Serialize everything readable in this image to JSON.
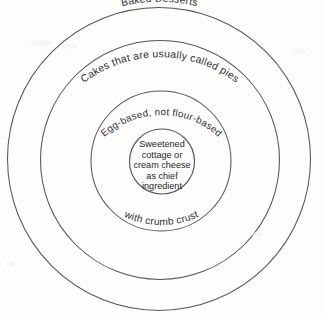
{
  "diagram": {
    "type": "concentric-venn",
    "background_color": "#fdfdfc",
    "stroke_color": "#56565a",
    "text_color": "#303034",
    "rings": [
      {
        "level": 1,
        "name": "outer-ring",
        "label": "Baked Desserts",
        "label_placement": "top-arc-inside"
      },
      {
        "level": 2,
        "name": "second-ring",
        "label": "Cakes that are usually called pies",
        "label_placement": "top-arc-inside"
      },
      {
        "level": 3,
        "name": "third-ring",
        "label": "Egg-based, not flour-based",
        "secondary_label": "with crumb crust",
        "label_placement": "top-arc-inside",
        "secondary_label_placement": "bottom-arc-inside"
      },
      {
        "level": 4,
        "name": "core-circle",
        "label_lines": [
          "Sweetened",
          "cottage or",
          "cream cheese",
          "as chief",
          "ingredient"
        ],
        "label_placement": "center"
      }
    ]
  }
}
